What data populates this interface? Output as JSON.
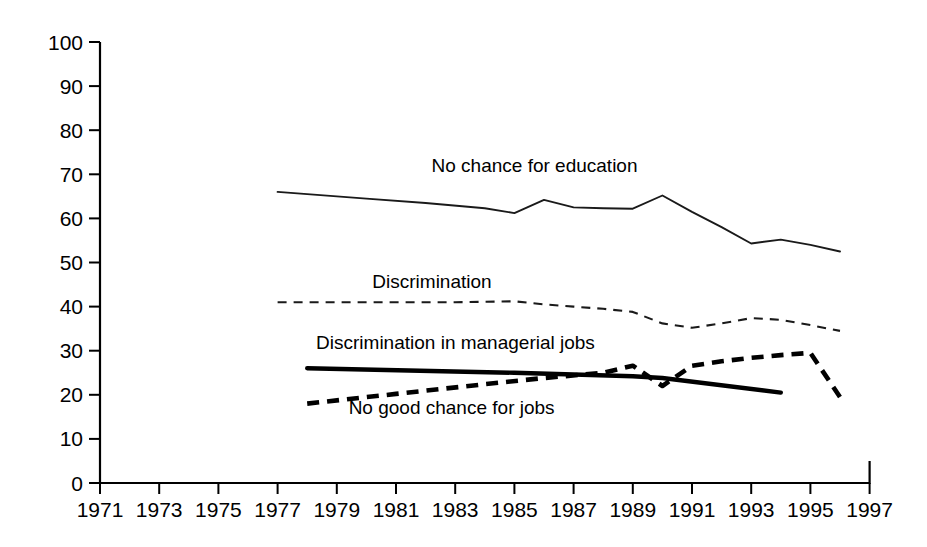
{
  "chart_data": {
    "type": "line",
    "title": "",
    "xlabel": "",
    "ylabel": "",
    "xlim": [
      1971,
      1997
    ],
    "ylim": [
      0,
      100
    ],
    "grid": false,
    "legend_position": "inline-labels",
    "x_ticks": [
      1971,
      1973,
      1975,
      1977,
      1979,
      1981,
      1983,
      1985,
      1987,
      1989,
      1991,
      1993,
      1995,
      1997
    ],
    "y_ticks": [
      0,
      10,
      20,
      30,
      40,
      50,
      60,
      70,
      80,
      90,
      100
    ],
    "series": [
      {
        "name": "No chance for education",
        "style": "thin-solid",
        "label_x": 1982.2,
        "label_y": 70.5,
        "x": [
          1977,
          1978,
          1980,
          1982,
          1984,
          1985,
          1986,
          1987,
          1988,
          1989,
          1990,
          1991,
          1992,
          1993,
          1994,
          1995,
          1996
        ],
        "values": [
          66,
          65.5,
          64.5,
          63.5,
          62.3,
          61.2,
          64.2,
          62.5,
          62.3,
          62.2,
          65.2,
          61.5,
          58,
          54.3,
          55.2,
          54,
          52.5
        ]
      },
      {
        "name": "Discrimination",
        "style": "thin-dashed",
        "label_x": 1980.2,
        "label_y": 44.2,
        "x": [
          1977,
          1979,
          1981,
          1983,
          1985,
          1986,
          1987,
          1988,
          1989,
          1990,
          1991,
          1992,
          1993,
          1994,
          1995,
          1996
        ],
        "values": [
          41,
          41,
          41,
          41,
          41.2,
          40.5,
          40,
          39.5,
          38.8,
          36.2,
          35.2,
          36.2,
          37.4,
          37,
          35.8,
          34.5
        ]
      },
      {
        "name": "Discrimination in managerial jobs",
        "style": "thick-solid",
        "label_x": 1978.3,
        "label_y": 30.4,
        "x": [
          1978,
          1985,
          1989,
          1990,
          1994
        ],
        "values": [
          26,
          25,
          24.2,
          23.8,
          20.5
        ]
      },
      {
        "name": "No good chance for jobs",
        "style": "thick-dashed",
        "label_x": 1979.4,
        "label_y": 15.6,
        "x": [
          1978,
          1981,
          1984,
          1986,
          1988,
          1989,
          1990,
          1991,
          1992,
          1993,
          1994,
          1995,
          1996
        ],
        "values": [
          18,
          20.2,
          22.4,
          23.8,
          25,
          26.6,
          22,
          26.6,
          27.6,
          28.4,
          29,
          29.5,
          19.5
        ]
      }
    ]
  },
  "axes": {
    "y_axis_name": "percent-axis",
    "x_axis_name": "year-axis"
  }
}
